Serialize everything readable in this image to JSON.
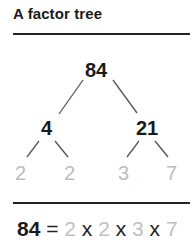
{
  "title": "A factor tree",
  "tree": {
    "root": "84",
    "level1": [
      "4",
      "21"
    ],
    "leaves": [
      "2",
      "2",
      "3",
      "7"
    ]
  },
  "equation": {
    "lhs": "84",
    "equals": "=",
    "factors": [
      "2",
      "2",
      "3",
      "7"
    ],
    "times": "x"
  },
  "colors": {
    "text": "#1a1a1a",
    "prime_factor": "#bdbdbd",
    "branch": "#555555"
  }
}
